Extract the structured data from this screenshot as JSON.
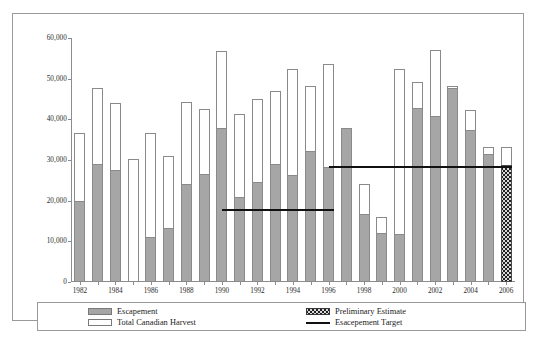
{
  "chart_data": {
    "type": "bar",
    "title": "",
    "subtitle": "",
    "xlabel": "",
    "ylabel": "",
    "stacked": true,
    "grid": false,
    "legend_position": "bottom",
    "ylim": [
      0,
      60000
    ],
    "ytick_values": [
      0,
      10000,
      20000,
      30000,
      40000,
      50000,
      60000
    ],
    "ytick_labels": [
      "0",
      "10,000",
      "20,000",
      "30,000",
      "40,000",
      "50,000",
      "60,000"
    ],
    "categories": [
      1982,
      1983,
      1984,
      1985,
      1986,
      1987,
      1988,
      1989,
      1990,
      1991,
      1992,
      1993,
      1994,
      1995,
      1996,
      1997,
      1998,
      1999,
      2000,
      2001,
      2002,
      2003,
      2004,
      2005,
      2006
    ],
    "xtick_labels": [
      "1982",
      "1984",
      "1986",
      "1988",
      "1990",
      "1992",
      "1994",
      "1996",
      "1998",
      "2000",
      "2002",
      "2004",
      "2006"
    ],
    "series": [
      {
        "name": "Escapement",
        "color": "#a6a6a6",
        "values": [
          20000,
          29000,
          27500,
          0,
          11000,
          13200,
          24000,
          26500,
          37800,
          21000,
          24500,
          29000,
          26300,
          32300,
          28300,
          37800,
          16800,
          12100,
          11700,
          42800,
          40800,
          47700,
          37300,
          31500,
          28800
        ]
      },
      {
        "name": "Total Canadian Harvest",
        "color": "#ffffff",
        "note": "plotted as stacked total (escapement + harvest)",
        "values": [
          36700,
          47800,
          44000,
          30200,
          36600,
          31000,
          44300,
          42500,
          56900,
          41200,
          44900,
          46900,
          52300,
          48100,
          53500,
          22900,
          24100,
          16100,
          52300,
          49100,
          57000,
          48200,
          42300,
          33300,
          33300
        ]
      }
    ],
    "preliminary_estimate_year": 2006,
    "target_lines": [
      {
        "label": "Esacepement Target",
        "value": 18000,
        "start_year": 1990,
        "end_year": 1996
      },
      {
        "label": "Esacepement Target",
        "value": 28500,
        "start_year": 1996,
        "end_year": 2006
      }
    ]
  },
  "legend": {
    "items": [
      {
        "label": "Escapement",
        "swatch": "escapement-swatch"
      },
      {
        "label": "Total Canadian Harvest",
        "swatch": "harvest-swatch"
      },
      {
        "label": "Preliminary Estimate",
        "swatch": "preliminary-swatch"
      },
      {
        "label": "Esacepement Target",
        "swatch": "target-line-swatch"
      }
    ]
  },
  "caption": {
    "text": ""
  }
}
